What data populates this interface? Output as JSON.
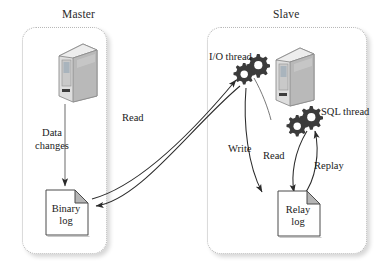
{
  "diagram": {
    "groups": [
      {
        "id": "master",
        "label": "Master"
      },
      {
        "id": "slave",
        "label": "Slave"
      }
    ],
    "nodes": [
      {
        "id": "master-server",
        "type": "server-icon",
        "label": ""
      },
      {
        "id": "slave-server",
        "type": "server-icon",
        "label": ""
      },
      {
        "id": "binary-log",
        "type": "document-icon",
        "label": "Binary log",
        "line1": "Binary",
        "line2": "log"
      },
      {
        "id": "relay-log",
        "type": "document-icon",
        "label": "Relay log",
        "line1": "Relay",
        "line2": "log"
      },
      {
        "id": "io-thread",
        "type": "gears-icon",
        "label": "I/O thread"
      },
      {
        "id": "sql-thread",
        "type": "gears-icon",
        "label": "SQL thread"
      }
    ],
    "edges": [
      {
        "id": "data-changes",
        "from": "master-server",
        "to": "binary-log",
        "label": "Data changes",
        "line1": "Data",
        "line2": "changes"
      },
      {
        "id": "read-left",
        "from": "binary-log",
        "to": "io-thread",
        "label": "Read"
      },
      {
        "id": "write",
        "from": "io-thread",
        "to": "relay-log",
        "label": "Write"
      },
      {
        "id": "read-right",
        "from": "relay-log",
        "to": "sql-thread",
        "label": "Read"
      },
      {
        "id": "replay",
        "from": "sql-thread",
        "to": "relay-log",
        "label": "Replay"
      }
    ],
    "colors": {
      "border": "#b8b8b8",
      "stroke": "#2b2b2b",
      "gear": "#3b3b3b",
      "server_light": "#e8e8e8",
      "server_mid": "#c9c9c9",
      "server_dark": "#a8a8a8",
      "doc_fill": "#ffffff",
      "doc_fold": "#b5b5b5",
      "text": "#1a1a1a",
      "background": "#ffffff"
    }
  }
}
